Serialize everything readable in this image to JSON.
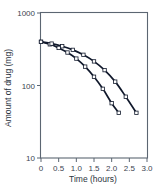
{
  "chart_data": {
    "type": "line",
    "title": "",
    "xlabel": "Time (hours)",
    "ylabel": "Amount of drug (mg)",
    "xlim": [
      0,
      3.0
    ],
    "ylim": [
      10,
      1000
    ],
    "yscale": "log",
    "xscale": "linear",
    "grid": false,
    "legend": "none",
    "xticks": [
      0,
      0.5,
      1.0,
      1.5,
      2.0,
      2.5,
      3.0
    ],
    "xticklabels": [
      "0",
      "0.5",
      "1.0",
      "1.5",
      "2.0",
      "2.5",
      "3.0"
    ],
    "yticks": [
      10,
      100,
      1000
    ],
    "yticklabels": [
      "10",
      "100",
      "1000"
    ],
    "marker": "open-square",
    "line_color": "#10182b",
    "marker_face_color": "#ffffff",
    "frame_color": "#5c6672",
    "background": "#ffffff",
    "series": [
      {
        "name": "curve-a",
        "x": [
          0.0,
          0.25,
          0.5,
          0.75,
          1.0,
          1.25,
          1.5,
          1.75,
          2.0,
          2.2
        ],
        "values": [
          400,
          370,
          330,
          285,
          235,
          182,
          132,
          90,
          57,
          42
        ]
      },
      {
        "name": "curve-b",
        "x": [
          0.0,
          0.3,
          0.6,
          0.9,
          1.2,
          1.5,
          1.8,
          2.1,
          2.4,
          2.7
        ],
        "values": [
          400,
          378,
          348,
          310,
          265,
          215,
          163,
          113,
          70,
          42
        ]
      }
    ]
  },
  "axes": {
    "x_title": "Time (hours)",
    "y_title": "Amount of drug (mg)"
  }
}
